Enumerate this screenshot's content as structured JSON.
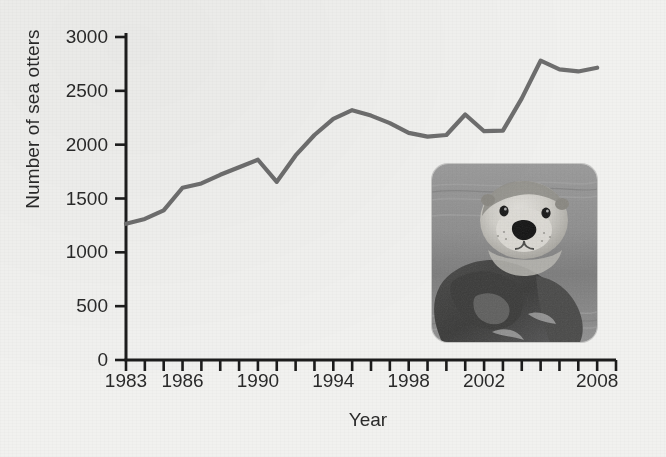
{
  "chart_data": {
    "type": "line",
    "title": "",
    "xlabel": "Year",
    "ylabel": "Number of sea otters",
    "xlim": [
      1983,
      2009
    ],
    "ylim": [
      0,
      3000
    ],
    "grid": false,
    "legend": null,
    "y_ticks": [
      0,
      500,
      1000,
      1500,
      2000,
      2500,
      3000
    ],
    "y_tick_labels": [
      "0",
      "500",
      "1000",
      "1500",
      "2000",
      "2500",
      "3000"
    ],
    "x_ticks": [
      1983,
      1984,
      1985,
      1986,
      1987,
      1988,
      1989,
      1990,
      1991,
      1992,
      1993,
      1994,
      1995,
      1996,
      1997,
      1998,
      1999,
      2000,
      2001,
      2002,
      2003,
      2004,
      2005,
      2006,
      2007,
      2008,
      2009
    ],
    "x_tick_labels": [
      "1983",
      "1986",
      "1990",
      "1994",
      "1998",
      "2002",
      "2008"
    ],
    "x_labeled_ticks": [
      1983,
      1986,
      1990,
      1994,
      1998,
      2002,
      2008
    ],
    "series": [
      {
        "name": "Sea otter population",
        "color": "#6e6e6e",
        "x": [
          1983,
          1984,
          1985,
          1986,
          1987,
          1988,
          1989,
          1990,
          1991,
          1992,
          1993,
          1994,
          1995,
          1996,
          1997,
          1998,
          1999,
          2000,
          2001,
          2002,
          2003,
          2004,
          2005,
          2006,
          2007,
          2008
        ],
        "values": [
          1265,
          1310,
          1390,
          1600,
          1640,
          1720,
          1790,
          1860,
          1655,
          1900,
          2090,
          2240,
          2320,
          2270,
          2200,
          2110,
          2075,
          2090,
          2280,
          2125,
          2130,
          2430,
          2780,
          2700,
          2680,
          2715
        ]
      }
    ]
  },
  "photo": {
    "name": "sea-otter-photograph",
    "caption": "",
    "alt_description": "Sea otter floating on its back in water"
  },
  "colors": {
    "background": "#f1f1ef",
    "plot_background": "#f4f4f2",
    "axis": "#1c1c1c",
    "line": "#6e6e6e",
    "text": "#2a2a2a"
  }
}
